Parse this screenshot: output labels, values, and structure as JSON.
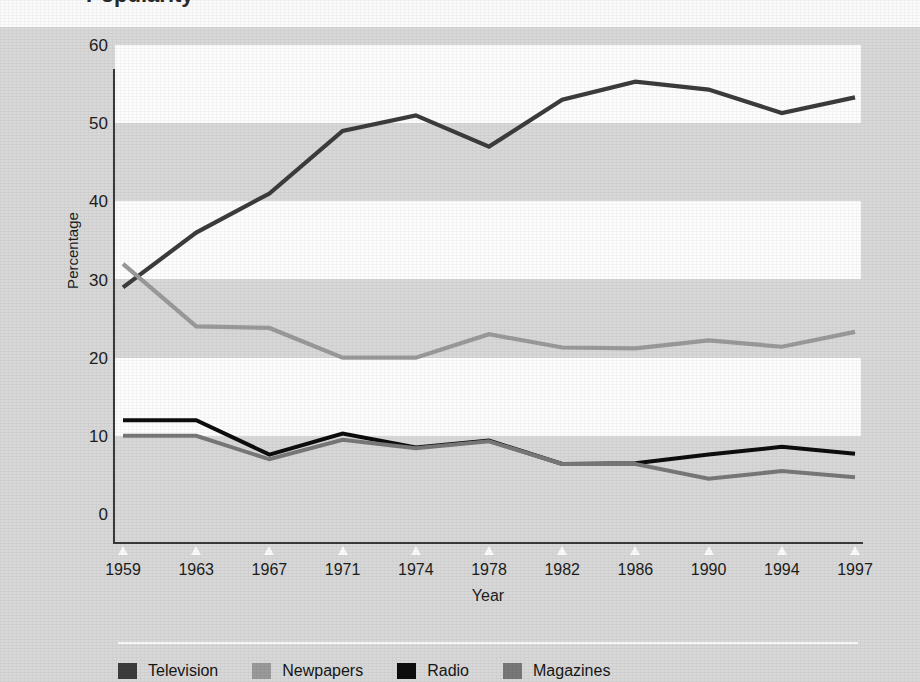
{
  "figure": {
    "title_remnant": "Popularity",
    "background_color": "#d8d8d8",
    "plot_band_color": "#fdfdfd"
  },
  "axes": {
    "y_title": "Percentage",
    "x_title": "Year",
    "y_ticks": [
      "0",
      "10",
      "20",
      "30",
      "40",
      "50",
      "60"
    ],
    "x_ticks": [
      "1959",
      "1963",
      "1967",
      "1971",
      "1974",
      "1978",
      "1982",
      "1986",
      "1990",
      "1994",
      "1997"
    ]
  },
  "legend": {
    "items": [
      {
        "label": "Television",
        "color": "#3c3c3c",
        "swatch": "legend-swatch-television"
      },
      {
        "label": "Newpapers",
        "color": "#9a9a9a",
        "swatch": "legend-swatch-newpapers"
      },
      {
        "label": "Radio",
        "color": "#0d0d0d",
        "swatch": "legend-swatch-radio"
      },
      {
        "label": "Magazines",
        "color": "#787878",
        "swatch": "legend-swatch-magazines"
      }
    ]
  },
  "chart_data": {
    "type": "line",
    "title": "Popularity",
    "xlabel": "Year",
    "ylabel": "Percentage",
    "xlim": [
      1959,
      1997
    ],
    "ylim": [
      0,
      60
    ],
    "ytick_step": 10,
    "grid": "alternating horizontal bands every 10 units",
    "legend_position": "bottom",
    "x": [
      1959,
      1963,
      1967,
      1971,
      1974,
      1978,
      1982,
      1986,
      1990,
      1994,
      1997
    ],
    "x_spacing": "categorical (evenly spaced tick labels)",
    "series": [
      {
        "name": "Television",
        "color": "#3c3c3c",
        "values": [
          29,
          36,
          41,
          49,
          51,
          47,
          53,
          55.3,
          54.3,
          51.3,
          53.3
        ]
      },
      {
        "name": "Newpapers",
        "color": "#9a9a9a",
        "values": [
          32,
          24,
          23.8,
          20,
          20,
          23,
          21.3,
          21.2,
          22.2,
          21.4,
          23.3
        ]
      },
      {
        "name": "Radio",
        "color": "#0d0d0d",
        "values": [
          12,
          12,
          7.6,
          10.3,
          8.5,
          9.4,
          6.4,
          6.5,
          7.6,
          8.6,
          7.7
        ]
      },
      {
        "name": "Magazines",
        "color": "#787878",
        "values": [
          10,
          10,
          7,
          9.5,
          8.4,
          9.3,
          6.4,
          6.4,
          4.5,
          5.5,
          4.7
        ]
      }
    ]
  }
}
